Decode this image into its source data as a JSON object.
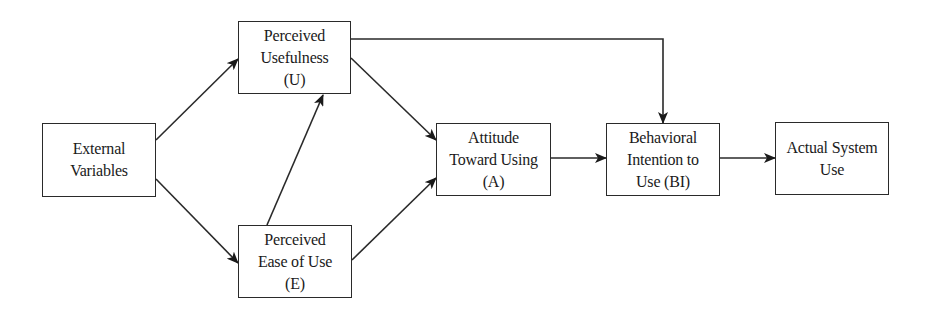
{
  "diagram": {
    "type": "flowchart",
    "nodes": [
      {
        "id": "ev",
        "lines": [
          "External",
          "Variables"
        ],
        "x": 42,
        "y": 123,
        "w": 114,
        "h": 74
      },
      {
        "id": "pu",
        "lines": [
          "Perceived",
          "Usefulness",
          "(U)"
        ],
        "x": 238,
        "y": 21,
        "w": 113,
        "h": 73
      },
      {
        "id": "peou",
        "lines": [
          "Perceived",
          "Ease of Use",
          "(E)"
        ],
        "x": 238,
        "y": 225,
        "w": 114,
        "h": 73
      },
      {
        "id": "a",
        "lines": [
          "Attitude",
          "Toward Using",
          "(A)"
        ],
        "x": 436,
        "y": 123,
        "w": 115,
        "h": 73
      },
      {
        "id": "bi",
        "lines": [
          "Behavioral",
          "Intention to",
          "Use (BI)"
        ],
        "x": 606,
        "y": 123,
        "w": 114,
        "h": 73
      },
      {
        "id": "asu",
        "lines": [
          "Actual System",
          "Use"
        ],
        "x": 775,
        "y": 122,
        "w": 114,
        "h": 73
      }
    ],
    "edges": [
      {
        "from": "ev",
        "to": "pu",
        "points": [
          [
            156,
            140
          ],
          [
            238,
            59
          ]
        ]
      },
      {
        "from": "ev",
        "to": "peou",
        "points": [
          [
            156,
            179
          ],
          [
            238,
            263
          ]
        ]
      },
      {
        "from": "peou",
        "to": "pu",
        "points": [
          [
            267,
            225
          ],
          [
            323,
            95
          ]
        ]
      },
      {
        "from": "pu",
        "to": "a",
        "points": [
          [
            351,
            58
          ],
          [
            436,
            140
          ]
        ]
      },
      {
        "from": "peou",
        "to": "a",
        "points": [
          [
            352,
            260
          ],
          [
            436,
            178
          ]
        ]
      },
      {
        "from": "pu",
        "to": "bi",
        "points": [
          [
            351,
            39
          ],
          [
            663,
            39
          ],
          [
            663,
            123
          ]
        ]
      },
      {
        "from": "a",
        "to": "bi",
        "points": [
          [
            551,
            158
          ],
          [
            606,
            158
          ]
        ]
      },
      {
        "from": "bi",
        "to": "asu",
        "points": [
          [
            720,
            158
          ],
          [
            775,
            158
          ]
        ]
      }
    ],
    "colors": {
      "stroke": "#2a2a2a",
      "fill": "#ffffff",
      "text": "#1a1a1a"
    }
  }
}
